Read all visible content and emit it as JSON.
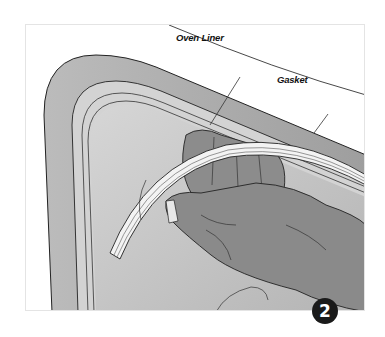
{
  "figure": {
    "callouts": {
      "oven_liner": "Oven Liner",
      "gasket": "Gasket"
    },
    "step_number": "2"
  },
  "colors": {
    "door_frame": "#a9a9a9",
    "liner_band": "#d4d4d4",
    "oven_cavity": "#c2c2c2",
    "hand": "#8a8a8a",
    "gasket": "#f2f2f2",
    "outline": "#2a2a2a",
    "badge": "#1a1a1a"
  }
}
